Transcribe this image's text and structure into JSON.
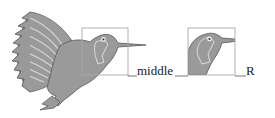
{
  "figure": {
    "labels": {
      "middle": "middle",
      "right": "R"
    },
    "colors": {
      "bird_fill": "#9a9a9a",
      "bird_outline": "#555555",
      "box_stroke": "#a8a8a8",
      "leader_line": "#555555",
      "eye_ring": "#dddddd"
    }
  }
}
